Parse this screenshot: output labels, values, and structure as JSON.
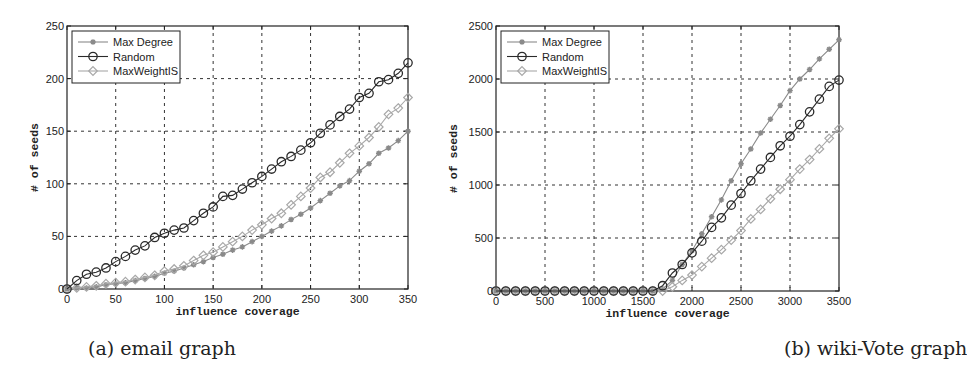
{
  "captions": {
    "a": "(a) email graph",
    "b": "(b) wiki-Vote graph"
  },
  "colors": {
    "max_degree": "#8a8a8a",
    "random": "#2a2a2a",
    "maxweightis": "#a8a8a8",
    "grid": "#333333",
    "axis": "#222222"
  },
  "chart_data": [
    {
      "type": "line",
      "title": "",
      "caption": "(a) email graph",
      "xlabel": "influence coverage",
      "ylabel": "# of seeds",
      "xlim": [
        0,
        350
      ],
      "ylim": [
        0,
        250
      ],
      "xticks": [
        0,
        50,
        100,
        150,
        200,
        250,
        300,
        350
      ],
      "yticks": [
        0,
        50,
        100,
        150,
        200,
        250
      ],
      "grid": true,
      "legend_position": "upper left",
      "x": [
        0,
        10,
        20,
        30,
        40,
        50,
        60,
        70,
        80,
        90,
        100,
        110,
        120,
        130,
        140,
        150,
        160,
        170,
        180,
        190,
        200,
        210,
        220,
        230,
        240,
        250,
        260,
        270,
        280,
        290,
        300,
        310,
        320,
        330,
        340,
        350
      ],
      "series": [
        {
          "name": "Max Degree",
          "marker": "asterisk",
          "values": [
            0,
            1,
            1,
            2,
            4,
            5,
            6,
            8,
            10,
            12,
            15,
            17,
            20,
            23,
            26,
            30,
            33,
            37,
            40,
            45,
            50,
            55,
            60,
            66,
            71,
            77,
            84,
            91,
            98,
            103,
            112,
            119,
            129,
            134,
            141,
            150
          ]
        },
        {
          "name": "Random",
          "marker": "circle",
          "values": [
            0,
            8,
            14,
            16,
            20,
            26,
            31,
            37,
            41,
            49,
            53,
            56,
            58,
            65,
            72,
            78,
            88,
            89,
            95,
            101,
            107,
            114,
            121,
            126,
            132,
            139,
            148,
            156,
            164,
            171,
            182,
            186,
            197,
            199,
            205,
            215
          ]
        },
        {
          "name": "MaxWeightIS",
          "marker": "diamond",
          "values": [
            0,
            1,
            2,
            3,
            5,
            6,
            7,
            9,
            11,
            13,
            17,
            19,
            22,
            27,
            32,
            35,
            40,
            45,
            50,
            56,
            61,
            67,
            72,
            80,
            88,
            96,
            106,
            111,
            120,
            129,
            136,
            144,
            154,
            166,
            172,
            182
          ]
        }
      ]
    },
    {
      "type": "line",
      "title": "",
      "caption": "(b) wiki-Vote graph",
      "xlabel": "influence coverage",
      "ylabel": "# of seeds",
      "xlim": [
        0,
        3500
      ],
      "ylim": [
        0,
        2500
      ],
      "xticks": [
        0,
        500,
        1000,
        1500,
        2000,
        2500,
        3000,
        3500
      ],
      "yticks": [
        0,
        500,
        1000,
        1500,
        2000,
        2500
      ],
      "grid": true,
      "legend_position": "upper left",
      "x": [
        0,
        100,
        200,
        300,
        400,
        500,
        600,
        700,
        800,
        900,
        1000,
        1100,
        1200,
        1300,
        1400,
        1500,
        1600,
        1700,
        1800,
        1900,
        2000,
        2100,
        2200,
        2300,
        2400,
        2500,
        2600,
        2700,
        2800,
        2900,
        3000,
        3100,
        3200,
        3300,
        3400,
        3500
      ],
      "series": [
        {
          "name": "Max Degree",
          "marker": "asterisk",
          "values": [
            0,
            0,
            0,
            0,
            0,
            0,
            0,
            0,
            0,
            0,
            0,
            0,
            0,
            0,
            0,
            0,
            0,
            20,
            100,
            250,
            380,
            540,
            700,
            860,
            1040,
            1200,
            1340,
            1490,
            1620,
            1750,
            1890,
            2000,
            2090,
            2190,
            2280,
            2370
          ]
        },
        {
          "name": "Random",
          "marker": "circle",
          "values": [
            0,
            0,
            0,
            0,
            0,
            0,
            0,
            0,
            0,
            0,
            0,
            0,
            0,
            0,
            0,
            0,
            0,
            50,
            170,
            250,
            360,
            470,
            600,
            690,
            810,
            920,
            1040,
            1150,
            1260,
            1370,
            1460,
            1570,
            1690,
            1810,
            1930,
            1990
          ]
        },
        {
          "name": "MaxWeightIS",
          "marker": "diamond",
          "values": [
            0,
            0,
            0,
            0,
            0,
            0,
            0,
            0,
            0,
            0,
            0,
            0,
            0,
            0,
            0,
            0,
            0,
            0,
            40,
            100,
            150,
            230,
            310,
            390,
            480,
            570,
            680,
            770,
            870,
            960,
            1050,
            1150,
            1240,
            1340,
            1440,
            1530
          ]
        }
      ]
    }
  ]
}
